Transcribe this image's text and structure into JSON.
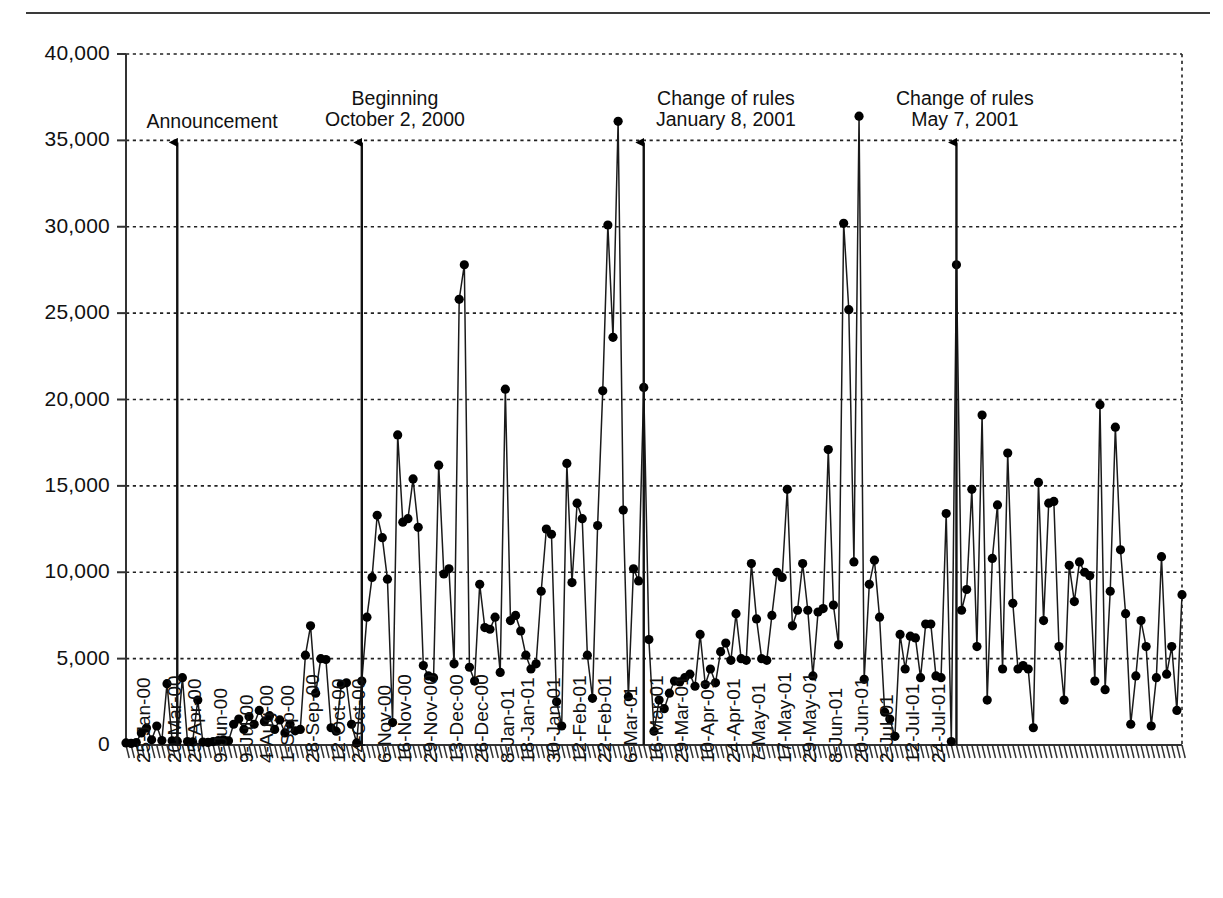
{
  "chart_data": {
    "type": "line",
    "title": "",
    "xlabel": "",
    "ylabel": "",
    "ylim": [
      0,
      40000
    ],
    "ytick_values": [
      0,
      5000,
      10000,
      15000,
      20000,
      25000,
      30000,
      35000,
      40000
    ],
    "ytick_labels": [
      "0",
      "5,000",
      "10,000",
      "15,000",
      "20,000",
      "25,000",
      "30,000",
      "35,000",
      "40,000"
    ],
    "grid": "horizontal-dotted",
    "legend": "none",
    "marker": "filled-circle",
    "xtick_labels": [
      "25-Jan-00",
      "20-Mar-00",
      "25-Apr-00",
      "9-Jun-00",
      "9-Jul-00",
      "4-Aug-00",
      "1-Sep-00",
      "28-Sep-00",
      "12-Oct-00",
      "24-Oct-00",
      "6-Nov-00",
      "16-Nov-00",
      "29-Nov-00",
      "13-Dec-00",
      "26-Dec-00",
      "8-Jan-01",
      "18-Jan-01",
      "30-Jan-01",
      "12-Feb-01",
      "22-Feb-01",
      "6-Mar-01",
      "16-Mar-01",
      "29-Mar-01",
      "10-Apr-01",
      "24-Apr-01",
      "7-May-01",
      "17-May-01",
      "29-May-01",
      "8-Jun-01",
      "20-Jun-01",
      "2-Jul-01",
      "12-Jul-01",
      "24-Jul-01"
    ],
    "xtick_indices": [
      0,
      6,
      10,
      15,
      20,
      24,
      28,
      33,
      38,
      42,
      47,
      51,
      56,
      61,
      66,
      71,
      75,
      80,
      85,
      90,
      95,
      100,
      105,
      110,
      115,
      120,
      125,
      130,
      135,
      140,
      145,
      150,
      155
    ],
    "values": [
      120,
      90,
      140,
      700,
      980,
      300,
      1100,
      260,
      3550,
      240,
      220,
      3900,
      200,
      180,
      2600,
      170,
      150,
      200,
      260,
      300,
      240,
      1200,
      1500,
      900,
      1650,
      1200,
      2000,
      1350,
      1700,
      900,
      1450,
      700,
      1200,
      820,
      900,
      5200,
      6900,
      3000,
      5000,
      4950,
      1000,
      800,
      3500,
      3600,
      1200,
      120,
      3700,
      7400,
      9700,
      13300,
      12000,
      9600,
      1300,
      17950,
      12900,
      13100,
      15400,
      12600,
      4600,
      4000,
      3900,
      16200,
      9900,
      10200,
      4700,
      25800,
      27800,
      4500,
      3700,
      9300,
      6800,
      6700,
      7400,
      4200,
      20600,
      7200,
      7500,
      6600,
      5200,
      4400,
      4700,
      8900,
      12500,
      12200,
      2500,
      1100,
      16300,
      9400,
      14000,
      13100,
      5200,
      2700,
      12700,
      20500,
      30100,
      23600,
      36100,
      13600,
      2800,
      10200,
      9500,
      20700,
      6100,
      800,
      2600,
      2100,
      3000,
      3700,
      3650,
      3900,
      4100,
      3400,
      6400,
      3500,
      4400,
      3600,
      5400,
      5900,
      4900,
      7600,
      5000,
      4900,
      10500,
      7300,
      5000,
      4900,
      7500,
      10000,
      9700,
      14800,
      6900,
      7800,
      10500,
      7800,
      4000,
      7700,
      7900,
      17100,
      8100,
      5800,
      30200,
      25200,
      10600,
      36400,
      3800,
      9300,
      10700,
      7400,
      1900,
      1500,
      500,
      6400,
      4400,
      6300,
      6200,
      3900,
      7000,
      7000,
      4000,
      3900,
      13400,
      200,
      27800,
      7800,
      9000,
      14800,
      5700,
      19100,
      2600,
      10800,
      13900,
      4400,
      16900,
      8200,
      4400,
      4600,
      4400,
      1000,
      15200,
      7200,
      14000,
      14100,
      5700,
      2600,
      10400,
      8300,
      10600,
      10000,
      9800,
      3700,
      19700,
      3200,
      8900,
      18400,
      11300,
      7600,
      1200,
      4000,
      7200,
      5700,
      1100,
      3900,
      10900,
      4100,
      5700,
      2000,
      8700
    ],
    "annotations": [
      {
        "label_line1": "Announcement",
        "label_line2": "",
        "x_index": 10,
        "arrow_to_value": 35000
      },
      {
        "label_line1": "Beginning",
        "label_line2": "October 2, 2000",
        "x_index": 46,
        "arrow_to_value": 35000
      },
      {
        "label_line1": "Change of rules",
        "label_line2": "January 8, 2001",
        "x_index": 101,
        "arrow_to_value": 35000
      },
      {
        "label_line1": "Change of rules",
        "label_line2": "May 7, 2001",
        "x_index": 162,
        "arrow_to_value": 35000
      }
    ]
  },
  "colors": {
    "line": "#1a1a1a",
    "marker": "#000000",
    "grid": "#222222",
    "axis": "#333333",
    "text": "#111111"
  }
}
